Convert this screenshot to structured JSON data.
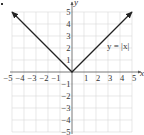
{
  "chart_data": {
    "type": "line",
    "title": "",
    "xlabel": "x",
    "ylabel": "y",
    "xlim": [
      -5,
      5
    ],
    "ylim": [
      -5,
      5
    ],
    "grid": true,
    "x_ticks": [
      -5,
      -4,
      -3,
      -2,
      -1,
      1,
      2,
      3,
      4,
      5
    ],
    "y_ticks": [
      -5,
      -4,
      -3,
      -2,
      -1,
      1,
      2,
      3,
      4,
      5
    ],
    "x_tick_labels": [
      "−5",
      "−4",
      "−3",
      "−2",
      "−1",
      "1",
      "2",
      "3",
      "4",
      "5"
    ],
    "y_tick_labels": [
      "5",
      "4",
      "3",
      "2",
      "1",
      "−1",
      "−2",
      "−3",
      "−4",
      "−5"
    ],
    "series": [
      {
        "name": "y = |x|",
        "x": [
          -5,
          0,
          5
        ],
        "y": [
          5,
          0,
          5
        ],
        "arrows_at_ends": true,
        "color": "#222222"
      }
    ],
    "annotations": [
      {
        "text": "y = |x|",
        "x": 3.9,
        "y": 2.4
      }
    ],
    "legend": null
  },
  "labels": {
    "x_axis": "x",
    "y_axis": "y",
    "function": "y = |x|"
  },
  "colors": {
    "grid": "#d8d8d8",
    "axis": "#555555",
    "line": "#222222"
  }
}
